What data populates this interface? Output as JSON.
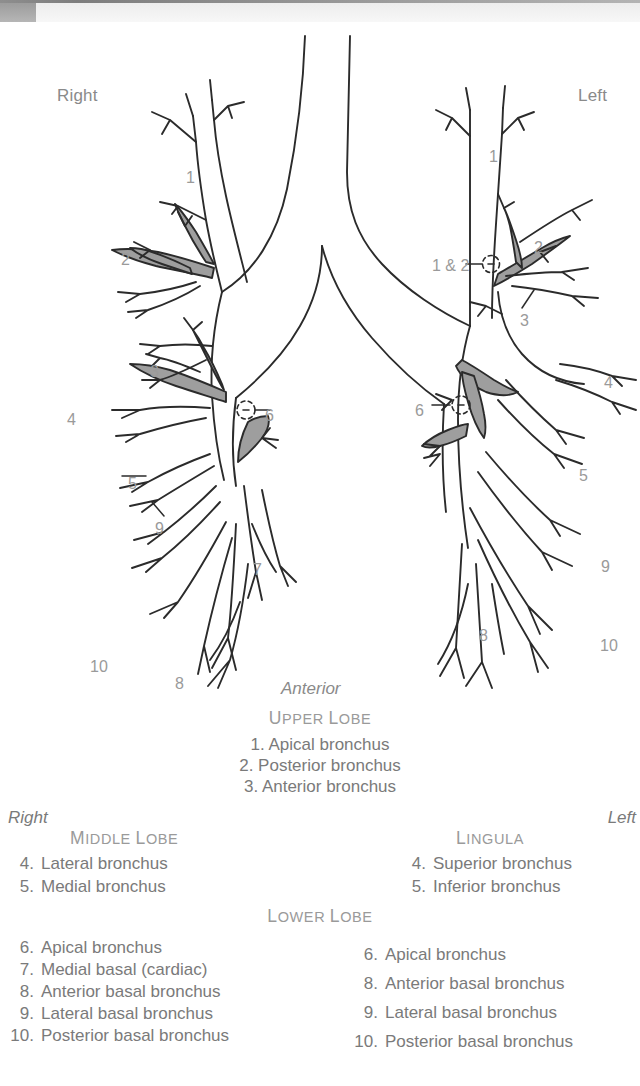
{
  "figure": {
    "orientation_top_left": "Right",
    "orientation_top_right": "Left",
    "view_label": "Anterior",
    "callouts": [
      {
        "id": "r-1",
        "text": "1",
        "x": 186,
        "y": 146
      },
      {
        "id": "r-2",
        "text": "2",
        "x": 121,
        "y": 228
      },
      {
        "id": "r-3",
        "text": "3",
        "x": 150,
        "y": 340
      },
      {
        "id": "r-4",
        "text": "4",
        "x": 67,
        "y": 388
      },
      {
        "id": "r-5",
        "text": "5",
        "x": 128,
        "y": 452
      },
      {
        "id": "r-6",
        "text": "6",
        "x": 265,
        "y": 384
      },
      {
        "id": "r-7",
        "text": "7",
        "x": 253,
        "y": 538
      },
      {
        "id": "r-8",
        "text": "8",
        "x": 175,
        "y": 652
      },
      {
        "id": "r-9",
        "text": "9",
        "x": 155,
        "y": 497
      },
      {
        "id": "r-10",
        "text": "10",
        "x": 90,
        "y": 635
      },
      {
        "id": "l-1",
        "text": "1",
        "x": 489,
        "y": 125
      },
      {
        "id": "l-1-2",
        "text": "1 & 2",
        "x": 432,
        "y": 234
      },
      {
        "id": "l-2",
        "text": "2",
        "x": 534,
        "y": 216
      },
      {
        "id": "l-3",
        "text": "3",
        "x": 520,
        "y": 289
      },
      {
        "id": "l-4",
        "text": "4",
        "x": 604,
        "y": 351
      },
      {
        "id": "l-5",
        "text": "5",
        "x": 579,
        "y": 444
      },
      {
        "id": "l-6",
        "text": "6",
        "x": 415,
        "y": 379
      },
      {
        "id": "l-8",
        "text": "8",
        "x": 479,
        "y": 604
      },
      {
        "id": "l-9",
        "text": "9",
        "x": 601,
        "y": 535
      },
      {
        "id": "l-10",
        "text": "10",
        "x": 600,
        "y": 614
      }
    ]
  },
  "legend": {
    "upper": {
      "heading_word1_cap": "U",
      "heading_word1_rest": "PPER",
      "heading_word2_cap": "L",
      "heading_word2_rest": "OBE",
      "items": [
        "1. Apical bronchus",
        "2. Posterior bronchus",
        "3. Anterior bronchus"
      ]
    },
    "side_right": "Right",
    "side_left": "Left",
    "middle_lobe": {
      "heading_word1_cap": "M",
      "heading_word1_rest": "IDDLE",
      "heading_word2_cap": "L",
      "heading_word2_rest": "OBE",
      "items": [
        {
          "n": "4.",
          "label": "Lateral bronchus"
        },
        {
          "n": "5.",
          "label": "Medial bronchus"
        }
      ]
    },
    "lingula": {
      "heading_word1_cap": "L",
      "heading_word1_rest": "INGULA",
      "items": [
        {
          "n": "4.",
          "label": "Superior bronchus"
        },
        {
          "n": "5.",
          "label": "Inferior bronchus"
        }
      ]
    },
    "lower": {
      "heading_word1_cap": "L",
      "heading_word1_rest": "OWER",
      "heading_word2_cap": "L",
      "heading_word2_rest": "OBE",
      "right_items": [
        {
          "n": "6.",
          "label": "Apical bronchus"
        },
        {
          "n": "7.",
          "label": "Medial basal (cardiac)"
        },
        {
          "n": "8.",
          "label": "Anterior basal bronchus"
        },
        {
          "n": "9.",
          "label": "Lateral basal bronchus"
        },
        {
          "n": "10.",
          "label": "Posterior basal bronchus"
        }
      ],
      "left_items": [
        {
          "n": "6.",
          "label": "Apical bronchus"
        },
        {
          "n": "8.",
          "label": "Anterior basal bronchus"
        },
        {
          "n": "9.",
          "label": "Lateral basal bronchus"
        },
        {
          "n": "10.",
          "label": "Posterior basal bronchus"
        }
      ]
    }
  },
  "colors": {
    "ink": "#2b2b2b",
    "shading": "#9e9e9e",
    "text": "#7a7a7a",
    "header_tab": "#a6a6a6"
  }
}
